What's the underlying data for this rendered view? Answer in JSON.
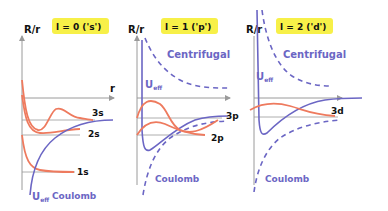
{
  "colors": {
    "orbital": "#ee7a5e",
    "potential": "#6b66c4",
    "axis": "#9a9a9a",
    "tag_bg": "#f7f048",
    "text": "#111111"
  },
  "panels": [
    {
      "tag": "l = 0  ('s')",
      "y_label": "R/r",
      "x_label": "r",
      "orbitals": [
        "3s",
        "2s",
        "1s"
      ],
      "potential_labels": {
        "ueff": "U",
        "ueff_sub": "eff",
        "coulomb": "Coulomb"
      }
    },
    {
      "tag": "l = 1  ('p')",
      "y_label": "R/r",
      "orbitals": [
        "3p",
        "2p"
      ],
      "potential_labels": {
        "centrifugal": "Centrifugal",
        "ueff": "U",
        "ueff_sub": "eff",
        "coulomb": "Coulomb"
      }
    },
    {
      "tag": "l = 2  ('d')",
      "y_label": "R/r",
      "orbitals": [
        "3d"
      ],
      "potential_labels": {
        "centrifugal": "Centrifugal",
        "ueff": "U",
        "ueff_sub": "eff",
        "coulomb": "Coulomb"
      }
    }
  ]
}
